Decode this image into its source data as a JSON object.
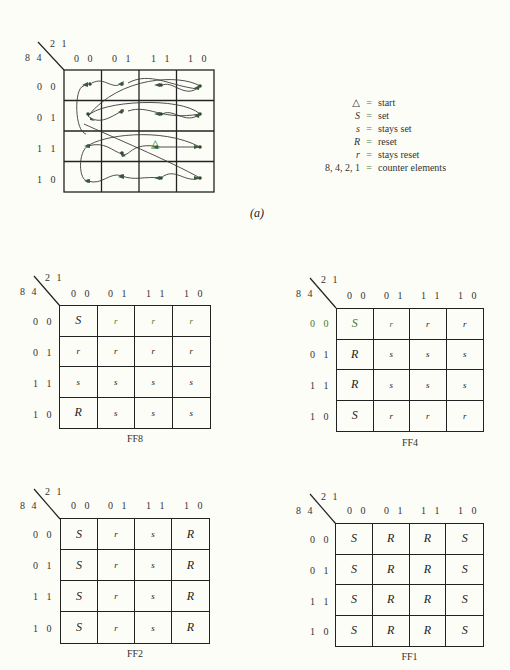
{
  "col_axis_label": "2 1",
  "row_axis_label": "8 4",
  "col_headers": [
    "0 0",
    "0 1",
    "1 1",
    "1 0"
  ],
  "row_headers": [
    "0 0",
    "0 1",
    "1 1",
    "1 0"
  ],
  "diagram_a": {
    "label": "(a)",
    "start_marker": "△",
    "start_cell": {
      "row": "1 1",
      "col": "1 1"
    }
  },
  "legend": [
    {
      "key": "△",
      "value": "start"
    },
    {
      "key": "S",
      "value": "set"
    },
    {
      "key": "s",
      "value": "stays set"
    },
    {
      "key": "R",
      "value": "reset"
    },
    {
      "key": "r",
      "value": "stays reset"
    },
    {
      "key": "8, 4, 2, 1",
      "value": "counter elements"
    }
  ],
  "legend_eq": "=",
  "maps": {
    "ff8": {
      "caption": "FF8",
      "cells": [
        [
          "S",
          "r",
          "r",
          "r"
        ],
        [
          "r",
          "r",
          "r",
          "r"
        ],
        [
          "s",
          "s",
          "s",
          "s"
        ],
        [
          "R",
          "s",
          "s",
          "s"
        ]
      ]
    },
    "ff4": {
      "caption": "FF4",
      "cells": [
        [
          "S",
          "r",
          "r",
          "r"
        ],
        [
          "R",
          "s",
          "s",
          "s"
        ],
        [
          "R",
          "s",
          "s",
          "s"
        ],
        [
          "S",
          "r",
          "r",
          "r"
        ]
      ]
    },
    "ff2": {
      "caption": "FF2",
      "cells": [
        [
          "S",
          "r",
          "s",
          "R"
        ],
        [
          "S",
          "r",
          "s",
          "R"
        ],
        [
          "S",
          "r",
          "s",
          "R"
        ],
        [
          "S",
          "r",
          "s",
          "R"
        ]
      ]
    },
    "ff1": {
      "caption": "FF1",
      "cells": [
        [
          "S",
          "R",
          "R",
          "S"
        ],
        [
          "S",
          "R",
          "R",
          "S"
        ],
        [
          "S",
          "R",
          "R",
          "S"
        ],
        [
          "S",
          "R",
          "R",
          "S"
        ]
      ]
    }
  }
}
